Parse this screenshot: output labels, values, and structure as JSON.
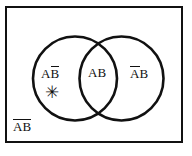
{
  "figure": {
    "type": "venn-diagram",
    "sets": [
      "A",
      "B"
    ],
    "universe_shape": "rectangle",
    "colors": {
      "stroke": "#111111",
      "background": "#ffffff"
    }
  },
  "geometry": {
    "universe": {
      "x": 5,
      "y": 6,
      "width": 178,
      "height": 137,
      "stroke_width": 2
    },
    "circle_a": {
      "cx": 75,
      "cy": 78.5,
      "r": 42,
      "stroke_width": 2.6
    },
    "circle_b": {
      "cx": 121.5,
      "cy": 78.5,
      "r": 42,
      "stroke_width": 2.6
    }
  },
  "labels": {
    "a_only": {
      "left_letter": "A",
      "right_letter": "B",
      "left_bar": false,
      "right_bar": false,
      "bar_over": "B",
      "text": "AB̅"
    },
    "intersection": {
      "left_letter": "A",
      "right_letter": "B",
      "bar_over": "none",
      "text": "AB"
    },
    "b_only": {
      "left_letter": "A",
      "right_letter": "B",
      "bar_over": "A",
      "text": "A̅B"
    },
    "neither": {
      "left_letter": "A",
      "right_letter": "B",
      "bar_over": "AB",
      "text": "A̅B̅"
    }
  },
  "marks": {
    "asterisk": {
      "glyph": "✳",
      "meaning": "marked-region",
      "region": "a_only"
    }
  }
}
